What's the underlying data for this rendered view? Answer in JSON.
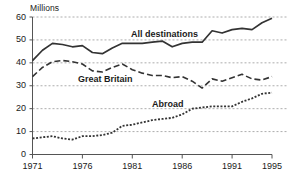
{
  "chart_data": {
    "type": "line",
    "title": "",
    "subtitle": "",
    "unit_label": "Millions",
    "xlabel": "",
    "ylabel": "Millions",
    "grid": true,
    "grid_orientation": "horizontal",
    "legend_position": "inline-annotations",
    "xlim": [
      1971,
      1995
    ],
    "ylim": [
      0,
      60
    ],
    "yticks": [
      60,
      50,
      40,
      30,
      20,
      10,
      0
    ],
    "ytick_labels": [
      "60",
      "50",
      "40",
      "30",
      "20",
      "10",
      "0"
    ],
    "xticks": [
      1971,
      1976,
      1981,
      1986,
      1991,
      1995
    ],
    "xtick_labels": [
      "1971",
      "1976",
      "1981",
      "1986",
      "1991",
      "1995"
    ],
    "x": [
      1971,
      1972,
      1973,
      1974,
      1975,
      1976,
      1977,
      1978,
      1979,
      1980,
      1981,
      1982,
      1983,
      1984,
      1985,
      1986,
      1987,
      1988,
      1989,
      1990,
      1991,
      1992,
      1993,
      1994,
      1995
    ],
    "series": [
      {
        "name": "All destinations",
        "style": "solid",
        "color": "#333333",
        "label_annotation": "All destinations",
        "values": [
          41.0,
          45.5,
          48.5,
          48.0,
          47.0,
          47.5,
          44.5,
          44.0,
          46.5,
          48.5,
          48.5,
          48.5,
          49.0,
          49.5,
          47.0,
          48.5,
          49.0,
          49.0,
          54.0,
          53.0,
          54.5,
          55.0,
          54.5,
          57.5,
          59.5
        ]
      },
      {
        "name": "Great Britain",
        "style": "dashed",
        "color": "#333333",
        "label_annotation": "Great Britain",
        "values": [
          34.0,
          38.0,
          40.5,
          41.0,
          40.5,
          39.5,
          36.5,
          36.0,
          38.0,
          39.5,
          37.0,
          35.5,
          34.5,
          34.5,
          33.5,
          34.0,
          32.0,
          29.0,
          33.0,
          32.0,
          33.5,
          35.0,
          33.0,
          32.5,
          34.0
        ]
      },
      {
        "name": "Abroad",
        "style": "dotted",
        "color": "#333333",
        "label_annotation": "Abroad",
        "values": [
          7.0,
          7.5,
          8.0,
          7.0,
          6.5,
          8.0,
          8.0,
          8.5,
          9.5,
          12.5,
          13.0,
          14.0,
          15.0,
          15.5,
          16.0,
          17.5,
          20.0,
          20.5,
          21.0,
          21.0,
          21.0,
          23.0,
          24.5,
          26.5,
          27.0
        ]
      }
    ]
  }
}
